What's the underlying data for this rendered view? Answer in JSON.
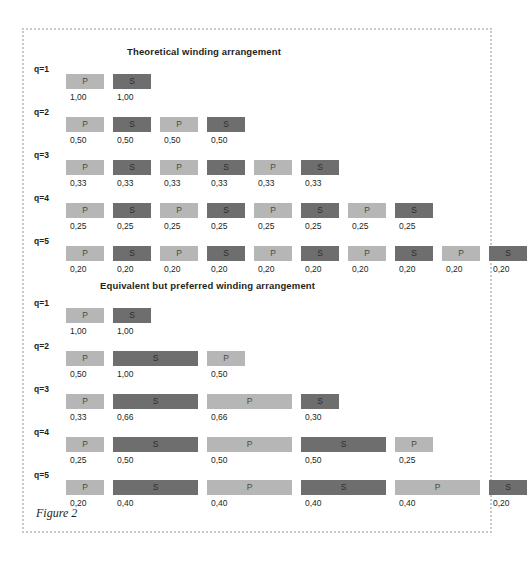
{
  "figure": {
    "caption": "Figure 2",
    "bar_colors": {
      "primary": "#b6b6b6",
      "secondary": "#6e6e6e"
    },
    "sections": [
      {
        "id": "theoretical",
        "title": "Theoretical winding arrangement",
        "title_x": 103,
        "title_y": 16,
        "rows": [
          {
            "label": "q=1",
            "label_x": 10,
            "label_y": 34,
            "bar_y": 44,
            "value_y": 62,
            "bars": [
              {
                "type": "P",
                "label": "P",
                "value": "1,00",
                "x": 42,
                "w": 38
              },
              {
                "type": "S",
                "label": "S",
                "value": "1,00",
                "x": 89,
                "w": 38
              }
            ]
          },
          {
            "label": "q=2",
            "label_x": 10,
            "label_y": 77,
            "bar_y": 87,
            "value_y": 105,
            "bars": [
              {
                "type": "P",
                "label": "P",
                "value": "0,50",
                "x": 42,
                "w": 38
              },
              {
                "type": "S",
                "label": "S",
                "value": "0,50",
                "x": 89,
                "w": 38
              },
              {
                "type": "P",
                "label": "P",
                "value": "0,50",
                "x": 136,
                "w": 38
              },
              {
                "type": "S",
                "label": "S",
                "value": "0,50",
                "x": 183,
                "w": 38
              }
            ]
          },
          {
            "label": "q=3",
            "label_x": 10,
            "label_y": 120,
            "bar_y": 130,
            "value_y": 148,
            "bars": [
              {
                "type": "P",
                "label": "P",
                "value": "0,33",
                "x": 42,
                "w": 38
              },
              {
                "type": "S",
                "label": "S",
                "value": "0,33",
                "x": 89,
                "w": 38
              },
              {
                "type": "P",
                "label": "P",
                "value": "0,33",
                "x": 136,
                "w": 38
              },
              {
                "type": "S",
                "label": "S",
                "value": "0,33",
                "x": 183,
                "w": 38
              },
              {
                "type": "P",
                "label": "P",
                "value": "0,33",
                "x": 230,
                "w": 38
              },
              {
                "type": "S",
                "label": "S",
                "value": "0,33",
                "x": 277,
                "w": 38
              }
            ]
          },
          {
            "label": "q=4",
            "label_x": 10,
            "label_y": 163,
            "bar_y": 173,
            "value_y": 191,
            "bars": [
              {
                "type": "P",
                "label": "P",
                "value": "0,25",
                "x": 42,
                "w": 38
              },
              {
                "type": "S",
                "label": "S",
                "value": "0,25",
                "x": 89,
                "w": 38
              },
              {
                "type": "P",
                "label": "P",
                "value": "0,25",
                "x": 136,
                "w": 38
              },
              {
                "type": "S",
                "label": "S",
                "value": "0,25",
                "x": 183,
                "w": 38
              },
              {
                "type": "P",
                "label": "P",
                "value": "0,25",
                "x": 230,
                "w": 38
              },
              {
                "type": "S",
                "label": "S",
                "value": "0,25",
                "x": 277,
                "w": 38
              },
              {
                "type": "P",
                "label": "P",
                "value": "0,25",
                "x": 324,
                "w": 38
              },
              {
                "type": "S",
                "label": "S",
                "value": "0,25",
                "x": 371,
                "w": 38
              }
            ]
          },
          {
            "label": "q=5",
            "label_x": 10,
            "label_y": 206,
            "bar_y": 216,
            "value_y": 234,
            "bars": [
              {
                "type": "P",
                "label": "P",
                "value": "0,20",
                "x": 42,
                "w": 38
              },
              {
                "type": "S",
                "label": "S",
                "value": "0,20",
                "x": 89,
                "w": 38
              },
              {
                "type": "P",
                "label": "P",
                "value": "0,20",
                "x": 136,
                "w": 38
              },
              {
                "type": "S",
                "label": "S",
                "value": "0,20",
                "x": 183,
                "w": 38
              },
              {
                "type": "P",
                "label": "P",
                "value": "0,20",
                "x": 230,
                "w": 38
              },
              {
                "type": "S",
                "label": "S",
                "value": "0,20",
                "x": 277,
                "w": 38
              },
              {
                "type": "P",
                "label": "P",
                "value": "0,20",
                "x": 324,
                "w": 38
              },
              {
                "type": "S",
                "label": "S",
                "value": "0,20",
                "x": 371,
                "w": 38
              },
              {
                "type": "P",
                "label": "P",
                "value": "0,20",
                "x": 418,
                "w": 38
              },
              {
                "type": "S",
                "label": "S",
                "value": "0,20",
                "x": 418,
                "w": 38
              }
            ]
          }
        ]
      },
      {
        "id": "preferred",
        "title": "Equivalent but preferred winding arrangement",
        "title_x": 76,
        "title_y": 250,
        "rows": [
          {
            "label": "q=1",
            "label_x": 10,
            "label_y": 268,
            "bar_y": 278,
            "value_y": 296,
            "bars": [
              {
                "type": "P",
                "label": "P",
                "value": "1,00",
                "x": 42,
                "w": 38
              },
              {
                "type": "S",
                "label": "S",
                "value": "1,00",
                "x": 89,
                "w": 38
              }
            ]
          },
          {
            "label": "q=2",
            "label_x": 10,
            "label_y": 311,
            "bar_y": 321,
            "value_y": 339,
            "bars": [
              {
                "type": "P",
                "label": "P",
                "value": "0,50",
                "x": 42,
                "w": 38
              },
              {
                "type": "S",
                "label": "S",
                "value": "1,00",
                "x": 89,
                "w": 85
              },
              {
                "type": "P",
                "label": "P",
                "value": "0,50",
                "x": 183,
                "w": 38
              }
            ]
          },
          {
            "label": "q=3",
            "label_x": 10,
            "label_y": 354,
            "bar_y": 364,
            "value_y": 382,
            "bars": [
              {
                "type": "P",
                "label": "P",
                "value": "0,33",
                "x": 42,
                "w": 38
              },
              {
                "type": "S",
                "label": "S",
                "value": "0,66",
                "x": 89,
                "w": 85
              },
              {
                "type": "P",
                "label": "P",
                "value": "0,66",
                "x": 183,
                "w": 85
              },
              {
                "type": "S",
                "label": "S",
                "value": "0,30",
                "x": 277,
                "w": 38
              }
            ]
          },
          {
            "label": "q=4",
            "label_x": 10,
            "label_y": 397,
            "bar_y": 407,
            "value_y": 425,
            "bars": [
              {
                "type": "P",
                "label": "P",
                "value": "0,25",
                "x": 42,
                "w": 38
              },
              {
                "type": "S",
                "label": "S",
                "value": "0,50",
                "x": 89,
                "w": 85
              },
              {
                "type": "P",
                "label": "P",
                "value": "0,50",
                "x": 183,
                "w": 85
              },
              {
                "type": "S",
                "label": "S",
                "value": "0,50",
                "x": 277,
                "w": 85
              },
              {
                "type": "P",
                "label": "P",
                "value": "0,25",
                "x": 371,
                "w": 38
              }
            ]
          },
          {
            "label": "q=5",
            "label_x": 10,
            "label_y": 440,
            "bar_y": 450,
            "value_y": 468,
            "bars": [
              {
                "type": "P",
                "label": "P",
                "value": "0,20",
                "x": 42,
                "w": 38
              },
              {
                "type": "S",
                "label": "S",
                "value": "0,40",
                "x": 89,
                "w": 85
              },
              {
                "type": "P",
                "label": "P",
                "value": "0,40",
                "x": 183,
                "w": 85
              },
              {
                "type": "S",
                "label": "S",
                "value": "0,40",
                "x": 277,
                "w": 85
              },
              {
                "type": "P",
                "label": "P",
                "value": "0,40",
                "x": 371,
                "w": 85
              },
              {
                "type": "S",
                "label": "S",
                "value": "0,20",
                "x": 418,
                "w": 38
              }
            ]
          }
        ]
      }
    ]
  },
  "chart_data": {
    "type": "bar",
    "layout": "two stacked diagram panels of horizontal winding-layer blocks",
    "panels": [
      {
        "title": "Theoretical winding arrangement",
        "rows": [
          {
            "q": 1,
            "sequence": [
              "P",
              "S"
            ],
            "values": [
              1.0,
              1.0
            ],
            "labels": [
              "1,00",
              "1,00"
            ]
          },
          {
            "q": 2,
            "sequence": [
              "P",
              "S",
              "P",
              "S"
            ],
            "values": [
              0.5,
              0.5,
              0.5,
              0.5
            ],
            "labels": [
              "0,50",
              "0,50",
              "0,50",
              "0,50"
            ]
          },
          {
            "q": 3,
            "sequence": [
              "P",
              "S",
              "P",
              "S",
              "P",
              "S"
            ],
            "values": [
              0.33,
              0.33,
              0.33,
              0.33,
              0.33,
              0.33
            ],
            "labels": [
              "0,33",
              "0,33",
              "0,33",
              "0,33",
              "0,33",
              "0,33"
            ]
          },
          {
            "q": 4,
            "sequence": [
              "P",
              "S",
              "P",
              "S",
              "P",
              "S",
              "P",
              "S"
            ],
            "values": [
              0.25,
              0.25,
              0.25,
              0.25,
              0.25,
              0.25,
              0.25,
              0.25
            ],
            "labels": [
              "0,25",
              "0,25",
              "0,25",
              "0,25",
              "0,25",
              "0,25",
              "0,25",
              "0,25"
            ]
          },
          {
            "q": 5,
            "sequence": [
              "P",
              "S",
              "P",
              "S",
              "P",
              "S",
              "P",
              "S",
              "P",
              "S"
            ],
            "values": [
              0.2,
              0.2,
              0.2,
              0.2,
              0.2,
              0.2,
              0.2,
              0.2,
              0.2,
              0.2
            ],
            "labels": [
              "0,20",
              "0,20",
              "0,20",
              "0,20",
              "0,20",
              "0,20",
              "0,20",
              "0,20",
              "0,20",
              "0,20"
            ]
          }
        ]
      },
      {
        "title": "Equivalent but preferred winding arrangement",
        "rows": [
          {
            "q": 1,
            "sequence": [
              "P",
              "S"
            ],
            "values": [
              1.0,
              1.0
            ],
            "labels": [
              "1,00",
              "1,00"
            ]
          },
          {
            "q": 2,
            "sequence": [
              "P",
              "S",
              "P"
            ],
            "values": [
              0.5,
              1.0,
              0.5
            ],
            "labels": [
              "0,50",
              "1,00",
              "0,50"
            ]
          },
          {
            "q": 3,
            "sequence": [
              "P",
              "S",
              "P",
              "S"
            ],
            "values": [
              0.33,
              0.66,
              0.66,
              0.3
            ],
            "labels": [
              "0,33",
              "0,66",
              "0,66",
              "0,30"
            ]
          },
          {
            "q": 4,
            "sequence": [
              "P",
              "S",
              "P",
              "S",
              "P"
            ],
            "values": [
              0.25,
              0.5,
              0.5,
              0.5,
              0.25
            ],
            "labels": [
              "0,25",
              "0,50",
              "0,50",
              "0,50",
              "0,25"
            ]
          },
          {
            "q": 5,
            "sequence": [
              "P",
              "S",
              "P",
              "S",
              "P",
              "S"
            ],
            "values": [
              0.2,
              0.4,
              0.4,
              0.4,
              0.4,
              0.2
            ],
            "labels": [
              "0,20",
              "0,40",
              "0,40",
              "0,40",
              "0,40",
              "0,20"
            ]
          }
        ]
      }
    ],
    "legend": [
      {
        "key": "P",
        "meaning": "Primary winding layer",
        "color": "#b6b6b6"
      },
      {
        "key": "S",
        "meaning": "Secondary winding layer",
        "color": "#6e6e6e"
      }
    ]
  }
}
